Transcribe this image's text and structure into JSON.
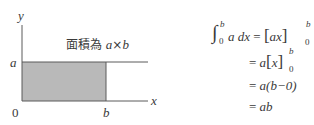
{
  "diagram": {
    "axes": {
      "x_label": "x",
      "y_label": "y",
      "origin_label": "0"
    },
    "marks": {
      "a_label": "a",
      "b_label": "b"
    },
    "area_note": {
      "prefix": "面積為 ",
      "expr_a": "a",
      "times": "×",
      "expr_b": "b"
    },
    "colors": {
      "fill": "#b9b9b9",
      "line": "#5a5a5a",
      "text": "#3a3a3a"
    }
  },
  "equation": {
    "line1": {
      "integral": "∫",
      "upper": "b",
      "lower": "0",
      "integrand": "a dx",
      "eq": "=",
      "lbr": "[",
      "body": "ax",
      "rbr": "]",
      "upper2": "b",
      "lower2": "0"
    },
    "line2": {
      "eq": "=",
      "pre": "a",
      "lbr": "[",
      "body": "x",
      "rbr": "]",
      "upper": "b",
      "lower": "0"
    },
    "line3": {
      "eq": "=",
      "body": "a(b−0)"
    },
    "line4": {
      "eq": "=",
      "body": "ab"
    }
  }
}
